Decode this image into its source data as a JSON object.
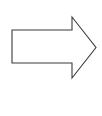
{
  "canvas": {
    "width": 102,
    "height": 116,
    "background_color": "#ffffff"
  },
  "diagram": {
    "shapes": [
      {
        "name": "right-arrow",
        "type": "polygon",
        "fill_color": "#ffffff",
        "stroke_color": "#3b3b3b",
        "stroke_width": 1.1,
        "direction": "right",
        "points": "12,30 72,30 72,17 96,47.5 72,78 72,63 12,63",
        "vertices": [
          {
            "label": "body-top-left",
            "x": 12,
            "y": 30
          },
          {
            "label": "body-top-right",
            "x": 72,
            "y": 30
          },
          {
            "label": "head-top",
            "x": 72,
            "y": 17
          },
          {
            "label": "tip",
            "x": 96,
            "y": 47.5
          },
          {
            "label": "head-bottom",
            "x": 72,
            "y": 78
          },
          {
            "label": "body-bottom-right",
            "x": 72,
            "y": 63
          },
          {
            "label": "body-bottom-left",
            "x": 12,
            "y": 63
          }
        ]
      }
    ]
  }
}
